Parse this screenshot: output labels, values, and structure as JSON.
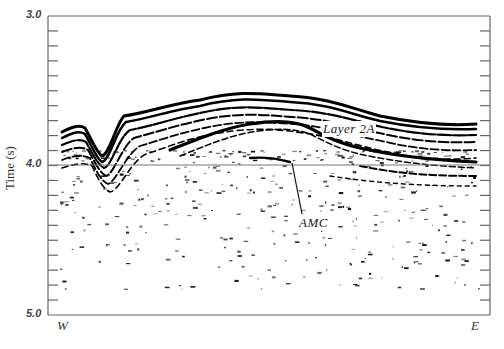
{
  "figure": {
    "type": "seismic-reflection-profile",
    "y_axis": {
      "title": "Time (s)",
      "tick_labels": [
        "3.0",
        "4.0",
        "5.0"
      ],
      "range": [
        3.0,
        5.0
      ],
      "minor_tick_step": 0.1
    },
    "x_axis": {
      "left_label": "W",
      "right_label": "E"
    },
    "reference_line": {
      "time": 4.0
    },
    "annotations": [
      {
        "id": "layer2a",
        "text": "Layer 2A"
      },
      {
        "id": "amc",
        "text": "AMC"
      }
    ],
    "colors": {
      "axis": "#666666",
      "reflectors": "#000000",
      "background": "#ffffff"
    }
  }
}
